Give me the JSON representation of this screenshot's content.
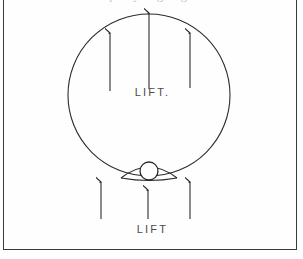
{
  "figure": {
    "type": "line-drawing",
    "frame": {
      "border_color": "#3a3a3a",
      "background_color": "#fefefe"
    },
    "caption_remnant": "p y g g",
    "labels": {
      "lift_inner": "LIFT.",
      "lift_outer": "LIFT"
    },
    "stroke_color": "#2b2b2b",
    "balloon": {
      "name": "balloon-envelope",
      "center_x": 149,
      "center_y": 95,
      "radius": 81
    },
    "basket": {
      "name": "balloon-basket",
      "center_x": 149,
      "center_y": 172,
      "radius": 9
    },
    "arrows_inner": [
      {
        "name": "lift-arrow-inner-left",
        "x": 110,
        "tail_y": 91,
        "tip_y": 33
      },
      {
        "name": "lift-arrow-inner-center",
        "x": 149,
        "tail_y": 89,
        "tip_y": 12
      },
      {
        "name": "lift-arrow-inner-right",
        "x": 190,
        "tail_y": 88,
        "tip_y": 33
      }
    ],
    "arrows_outer": [
      {
        "name": "lift-arrow-outer-left",
        "x": 101,
        "tail_y": 219,
        "tip_y": 182
      },
      {
        "name": "lift-arrow-outer-center",
        "x": 148,
        "tail_y": 219,
        "tip_y": 190
      },
      {
        "name": "lift-arrow-outer-right",
        "x": 190,
        "tail_y": 219,
        "tip_y": 182
      }
    ]
  }
}
